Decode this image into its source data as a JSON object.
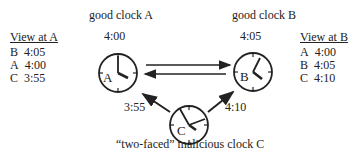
{
  "titles": {
    "clock_a": "good clock A",
    "clock_b": "good clock B",
    "clock_c": "“two-faced”  malicious clock C"
  },
  "clocks": {
    "a": {
      "label": "A",
      "time": "4:00"
    },
    "b": {
      "label": "B",
      "time": "4:05"
    },
    "c": {
      "label": "C",
      "to_a": "3:55",
      "to_b": "4:10"
    }
  },
  "view_a": {
    "heading": "View at A",
    "rows": [
      {
        "clock": "B",
        "time": "4:05"
      },
      {
        "clock": "A",
        "time": "4:00"
      },
      {
        "clock": "C",
        "time": "3:55"
      }
    ]
  },
  "view_b": {
    "heading": "View at B",
    "rows": [
      {
        "clock": "A",
        "time": "4:00"
      },
      {
        "clock": "B",
        "time": "4:05"
      },
      {
        "clock": "C",
        "time": "4:10"
      }
    ]
  }
}
